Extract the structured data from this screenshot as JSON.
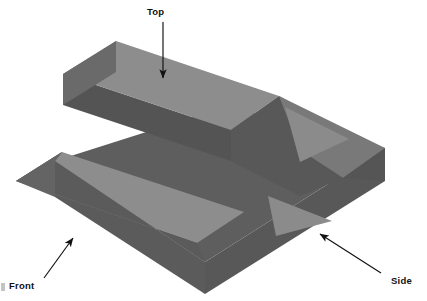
{
  "figure": {
    "background_color": "#ffffff",
    "colors": {
      "face_light": "#8d8d8d",
      "face_dark": "#585858",
      "face_mid": "#6f6f6f",
      "outline": "#7b7b7b",
      "annotation": "#111111",
      "artifact": "#b9b9b9"
    },
    "annotations": [
      {
        "id": "top",
        "label": "Top",
        "label_x": 147,
        "label_y": 15,
        "arrow_from_x": 163,
        "arrow_from_y": 22,
        "arrow_to_x": 163,
        "arrow_to_y": 78,
        "points_to": "upper-top-face"
      },
      {
        "id": "front",
        "label": "Front",
        "label_x": 9,
        "label_y": 286,
        "arrow_from_x": 45,
        "arrow_from_y": 277,
        "arrow_to_x": 73,
        "arrow_to_y": 237,
        "points_to": "front-vertical-face"
      },
      {
        "id": "side",
        "label": "Side",
        "label_x": 393,
        "label_y": 281,
        "arrow_from_x": 379,
        "arrow_from_y": 272,
        "arrow_to_x": 320,
        "arrow_to_y": 233,
        "points_to": "side-vertical-face"
      }
    ],
    "faces": [
      {
        "name": "upper-top-face",
        "shade": "light",
        "points": "116,42 278,97 234,129 72,76"
      },
      {
        "name": "upper-front-face",
        "shade": "dark",
        "points": "72,76 234,129 234,159 72,106"
      },
      {
        "name": "lower-top-face",
        "shade": "light",
        "points": "62,152 243,213 198,243 17,182"
      },
      {
        "name": "front-vertical-face",
        "shade": "dark",
        "points": "55,160 205,262 205,292 55,196"
      },
      {
        "name": "side-vertical-face",
        "shade": "dark",
        "points": "205,262 385,148 385,178 205,292"
      },
      {
        "name": "chamfer-upper",
        "shade": "mid",
        "points": "278,97 340,131 300,160 250,133"
      },
      {
        "name": "wedge-triangle-lower",
        "shade": "light",
        "points": "272,196 330,223 280,233"
      }
    ]
  }
}
